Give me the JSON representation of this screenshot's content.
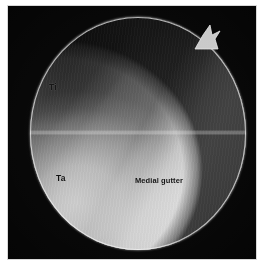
{
  "figure": {
    "kind": "arthroscopy-photograph",
    "view_shape": "circular-scope-field"
  },
  "annotations": [
    {
      "id": "ti",
      "label": "Ti",
      "meaning": "tibia"
    },
    {
      "id": "ta",
      "label": "Ta",
      "meaning": "talus"
    },
    {
      "id": "medial-gutter",
      "label": "Medial gutter",
      "meaning": "medial gutter of ankle joint"
    }
  ],
  "labels": {
    "ti": "Ti",
    "ta": "Ta",
    "medial_gutter": "Medial gutter"
  },
  "colors": {
    "page_background": "#ffffff",
    "frame_background": "#050505",
    "frame_border": "#d8d8d8",
    "scope_midtone": "#9a9a9a",
    "scope_highlight": "#d6d6d6",
    "scope_shadow": "#4a4a4a",
    "annotation_text": "#0d0d0d",
    "scope_rim": "#f5f5f5"
  },
  "geometry": {
    "image_width": 267,
    "image_height": 271,
    "frame_left": 7,
    "frame_top": 5,
    "frame_width": 250,
    "frame_height": 255,
    "scope_center_x": 137,
    "scope_center_y": 132,
    "scope_radius_x": 108,
    "scope_radius_y": 116,
    "notch_present": true
  }
}
